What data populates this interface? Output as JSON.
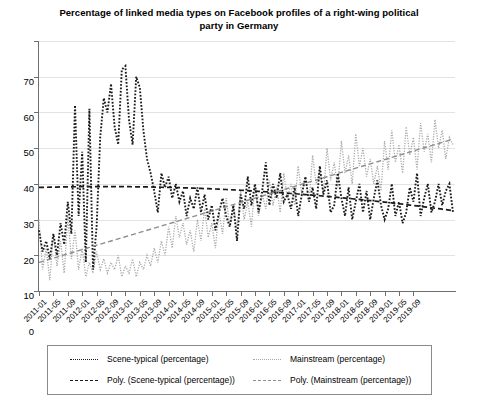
{
  "chart_data": {
    "type": "line",
    "title": "Percentage of linked media types on Facebook profiles of a right-wing political party in Germany",
    "xlabel": "",
    "ylabel": "",
    "ylim": [
      0,
      70
    ],
    "ytick_step": 10,
    "ytick_labels": [
      "0",
      "10",
      "20",
      "30",
      "40",
      "50",
      "60",
      "70"
    ],
    "grid": true,
    "legend_position": "bottom",
    "x_start": "2011-01",
    "x_end": "2019-12",
    "x_tick_interval_months": 4,
    "tick_labels": [
      "2011-01",
      "2011-05",
      "2011-09",
      "2012-01",
      "2012-05",
      "2012-09",
      "2013-01",
      "2013-05",
      "2013-09",
      "2014-01",
      "2014-05",
      "2014-09",
      "2015-01",
      "2015-05",
      "2015-09",
      "2016-01",
      "2016-05",
      "2016-09",
      "2017-01",
      "2017-05",
      "2017-09",
      "2018-01",
      "2018-05",
      "2018-09",
      "2019-01",
      "2019-05",
      "2019-09"
    ],
    "series": [
      {
        "name": "Scene-typical (percentage)",
        "style": "dotted",
        "color": "#1a1a1a",
        "values": [
          17,
          11,
          14,
          9,
          16,
          10,
          19,
          13,
          25,
          16,
          52,
          21,
          39,
          8,
          51,
          6,
          18,
          43,
          54,
          50,
          58,
          46,
          41,
          62,
          63,
          48,
          41,
          60,
          57,
          45,
          37,
          33,
          28,
          22,
          33,
          29,
          32,
          26,
          30,
          25,
          28,
          21,
          26,
          23,
          29,
          22,
          27,
          20,
          24,
          17,
          22,
          26,
          21,
          18,
          24,
          14,
          27,
          23,
          32,
          24,
          30,
          22,
          28,
          36,
          24,
          30,
          26,
          33,
          25,
          27,
          23,
          29,
          21,
          27,
          32,
          25,
          29,
          23,
          35,
          27,
          31,
          22,
          24,
          33,
          26,
          21,
          29,
          20,
          25,
          30,
          22,
          28,
          20,
          26,
          31,
          24,
          20,
          23,
          30,
          21,
          25,
          19,
          22,
          29,
          25,
          33,
          21,
          26,
          30,
          22,
          25,
          30,
          24,
          28,
          30,
          22
        ],
        "trend": {
          "name": "Poly. (Scene-typical (percentage))",
          "style": "dashed",
          "color": "#1a1a1a",
          "start_value": 29,
          "end_value": 22.5,
          "peak_value": 30.5
        }
      },
      {
        "name": "Mainstream (percentage)",
        "style": "dotted",
        "color": "#a8a8a8",
        "values": [
          20,
          6,
          12,
          3,
          16,
          7,
          14,
          5,
          21,
          9,
          17,
          6,
          12,
          4,
          8,
          5,
          11,
          6,
          9,
          5,
          8,
          6,
          10,
          4,
          7,
          5,
          9,
          4,
          8,
          6,
          10,
          7,
          12,
          8,
          14,
          10,
          18,
          12,
          21,
          15,
          19,
          13,
          17,
          11,
          20,
          14,
          23,
          15,
          19,
          12,
          22,
          16,
          26,
          18,
          24,
          17,
          28,
          20,
          25,
          18,
          30,
          21,
          27,
          23,
          31,
          24,
          29,
          22,
          33,
          26,
          30,
          24,
          35,
          27,
          32,
          25,
          38,
          30,
          34,
          27,
          40,
          31,
          36,
          29,
          42,
          33,
          38,
          30,
          44,
          35,
          40,
          32,
          37,
          30,
          35,
          28,
          42,
          34,
          45,
          36,
          41,
          33,
          46,
          38,
          43,
          34,
          47,
          39,
          44,
          36,
          48,
          40,
          45,
          37,
          43,
          41
        ],
        "trend": {
          "name": "Poly. (Mainstream (percentage))",
          "style": "dashed",
          "color": "#8d8d8d",
          "start_value": 8,
          "end_value": 42.5
        }
      }
    ]
  },
  "legend": {
    "entries": [
      {
        "label": "Scene-typical (percentage)",
        "style": "dotted",
        "color": "#1a1a1a"
      },
      {
        "label": "Mainstream (percentage)",
        "style": "dotted",
        "color": "#a8a8a8"
      },
      {
        "label": "Poly. (Scene-typical (percentage))",
        "style": "dashed",
        "color": "#1a1a1a"
      },
      {
        "label": "Poly. (Mainstream (percentage))",
        "style": "dashed",
        "color": "#8d8d8d"
      }
    ]
  }
}
